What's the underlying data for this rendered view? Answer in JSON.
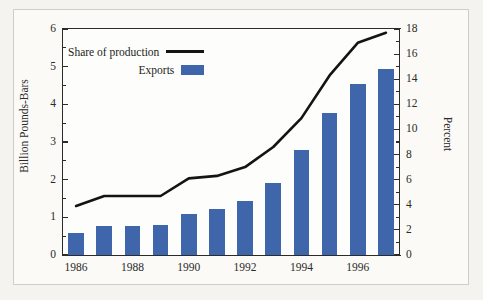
{
  "figure": {
    "background": "#f4f3ef",
    "plot_background": "#fdfdfb",
    "frame_color": "#3a3a38"
  },
  "legend": {
    "position": "top-left-inside",
    "entries": [
      {
        "label": "Share of production",
        "marker": "line",
        "color": "#141413"
      },
      {
        "label": "Exports",
        "marker": "swatch",
        "color": "#3f65ab"
      }
    ]
  },
  "chart_data": {
    "type": "bar",
    "title": "",
    "xlabel": "",
    "ylabel": "Billion Pounds-Bars",
    "y2label": "Percent",
    "grid": false,
    "legend_position": "upper left",
    "categories": [
      1986,
      1987,
      1988,
      1989,
      1990,
      1991,
      1992,
      1993,
      1994,
      1995,
      1996,
      1997
    ],
    "x_tick_labels": [
      "1986",
      "1988",
      "1990",
      "1992",
      "1994",
      "1996"
    ],
    "x_tick_values": [
      1986,
      1988,
      1990,
      1992,
      1994,
      1996
    ],
    "ylim": [
      0,
      6
    ],
    "y_ticks": [
      0,
      1,
      2,
      3,
      4,
      5,
      6
    ],
    "y_tick_labels": [
      "0",
      "1",
      "2",
      "3",
      "4",
      "5",
      "6"
    ],
    "y_minor_step": 0.5,
    "y2lim": [
      0,
      18
    ],
    "y2_ticks": [
      0,
      2,
      4,
      6,
      8,
      10,
      12,
      14,
      16,
      18
    ],
    "y2_tick_labels": [
      "0",
      "2",
      "4",
      "6",
      "8",
      "10",
      "12",
      "14",
      "16",
      "18"
    ],
    "y2_minor_step": 1,
    "series": [
      {
        "name": "Exports",
        "type": "bar",
        "axis": "left",
        "units": "Billion Pounds",
        "color": "#3f65ab",
        "values": [
          0.58,
          0.77,
          0.77,
          0.81,
          1.08,
          1.21,
          1.44,
          1.9,
          2.78,
          3.76,
          4.53,
          4.93
        ]
      },
      {
        "name": "Share of production",
        "type": "line",
        "axis": "right",
        "units": "Percent",
        "color": "#141413",
        "values": [
          3.9,
          4.7,
          4.7,
          4.7,
          6.1,
          6.3,
          7.0,
          8.6,
          10.9,
          14.3,
          16.9,
          17.7
        ]
      }
    ]
  }
}
